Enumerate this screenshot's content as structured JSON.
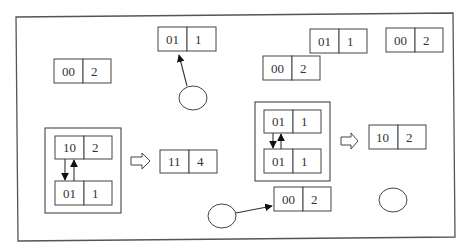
{
  "diagram": {
    "records": [
      {
        "id": "top-center",
        "key": "01",
        "value": "1"
      },
      {
        "id": "left",
        "key": "00",
        "value": "2"
      },
      {
        "id": "top-right-a",
        "key": "01",
        "value": "1"
      },
      {
        "id": "top-right-b",
        "key": "00",
        "value": "2"
      },
      {
        "id": "mid-right",
        "key": "00",
        "value": "2"
      },
      {
        "id": "merge-left-result",
        "key": "11",
        "value": "4"
      },
      {
        "id": "merge-right-result",
        "key": "10",
        "value": "2"
      },
      {
        "id": "bottom-center",
        "key": "00",
        "value": "2"
      }
    ],
    "groups": [
      {
        "id": "left-group",
        "top": {
          "key": "10",
          "value": "2"
        },
        "bottom": {
          "key": "01",
          "value": "1"
        }
      },
      {
        "id": "right-group",
        "top": {
          "key": "01",
          "value": "1"
        },
        "bottom": {
          "key": "01",
          "value": "1"
        }
      }
    ],
    "nodes": [
      "circle-top",
      "circle-bottom-left",
      "circle-right"
    ],
    "edges": [
      {
        "from": "circle-top",
        "to": "top-center"
      },
      {
        "from": "circle-bottom-left",
        "to": "bottom-center"
      }
    ],
    "transforms": [
      {
        "from": "left-group",
        "to": "merge-left-result",
        "icon": "hollow-right-arrow"
      },
      {
        "from": "right-group",
        "to": "merge-right-result",
        "icon": "hollow-right-arrow"
      }
    ]
  }
}
